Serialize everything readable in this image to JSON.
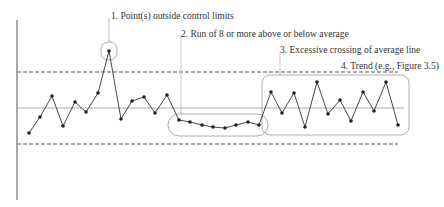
{
  "chart_data": {
    "type": "line",
    "title": "",
    "xlabel": "",
    "ylabel": "",
    "grid": false,
    "control_lines": {
      "ucl": {
        "style": "dashed",
        "y_px": 72
      },
      "center": {
        "style": "solid",
        "y_px": 108
      },
      "lcl": {
        "style": "dashed",
        "y_px": 144
      }
    },
    "series": [
      {
        "name": "process",
        "x": [
          29,
          40,
          52,
          63,
          75,
          86,
          98,
          109,
          121,
          132,
          144,
          155,
          167,
          179,
          190,
          202,
          213,
          225,
          236,
          248,
          259,
          271,
          282,
          294,
          305,
          317,
          328,
          340,
          351,
          363,
          374,
          386,
          398
        ],
        "y": [
          133,
          117,
          96,
          126,
          102,
          112,
          93,
          51,
          119,
          101,
          97,
          113,
          95,
          120,
          122,
          125,
          127,
          128,
          125,
          122,
          125,
          92,
          113,
          93,
          127,
          82,
          114,
          100,
          121,
          92,
          111,
          82,
          125
        ]
      }
    ],
    "annotations": [
      {
        "id": 1,
        "text": "1. Point(s) outside control limits"
      },
      {
        "id": 2,
        "text": "2. Run of 8 or more above or below average"
      },
      {
        "id": 3,
        "text": "3. Excessive crossing of average line"
      },
      {
        "id": 4,
        "text": "4. Trend (e.g., Figure 3.5)"
      }
    ]
  },
  "colors": {
    "line": "#333333",
    "point": "#222222",
    "control": "#555555",
    "center": "#888888",
    "callout": "#aaaaaa"
  }
}
